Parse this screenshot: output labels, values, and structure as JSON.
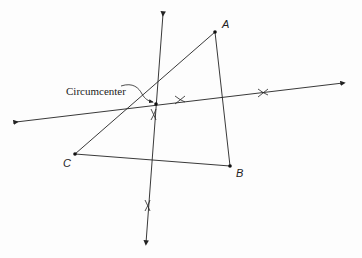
{
  "diagram": {
    "type": "geometry-construction",
    "title": "",
    "points": {
      "A": {
        "label": "A",
        "x": 215,
        "y": 32
      },
      "B": {
        "label": "B",
        "x": 230,
        "y": 166
      },
      "C": {
        "label": "C",
        "x": 75,
        "y": 154
      },
      "circumcenter": {
        "x": 156,
        "y": 104
      }
    },
    "annotation": {
      "text": "Circumcenter"
    },
    "perpendicular_bisectors": [
      {
        "name": "bisector-AC",
        "from": [
          16,
          122
        ],
        "to": [
          343,
          83
        ]
      },
      {
        "name": "bisector-BC",
        "from": [
          163,
          14
        ],
        "to": [
          146,
          243
        ]
      }
    ],
    "line_color": "#222222"
  }
}
